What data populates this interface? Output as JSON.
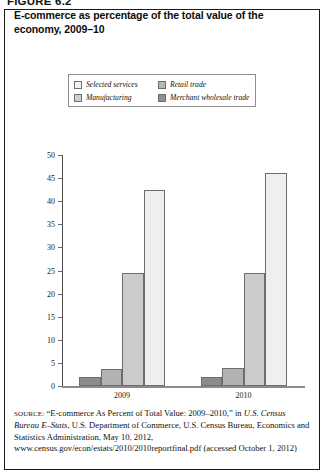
{
  "figure": {
    "number_label": "FIGURE 6.2"
  },
  "title": "E-commerce as percentage of the total value of the economy, 2009–10",
  "legend": {
    "position": "top-center",
    "entries": [
      {
        "label": "Selected services",
        "color": "#f2f2f2",
        "swatch_name": "legend-swatch-selected-services"
      },
      {
        "label": "Retail trade",
        "color": "#b5b5b5",
        "swatch_name": "legend-swatch-retail-trade"
      },
      {
        "label": "Manufacturing",
        "color": "#cfcfcf",
        "swatch_name": "legend-swatch-manufacturing"
      },
      {
        "label": "Merchant wholesale trade",
        "color": "#8f8f8f",
        "swatch_name": "legend-swatch-merchant-wholesale-trade"
      }
    ]
  },
  "chart_data": {
    "type": "bar",
    "title": "E-commerce as percentage of the total value of the economy, 2009–10",
    "xlabel": "",
    "ylabel": "",
    "categories": [
      "2009",
      "2010"
    ],
    "ylim": [
      0,
      50
    ],
    "yticks": [
      0,
      5,
      10,
      15,
      20,
      25,
      30,
      35,
      40,
      45,
      50
    ],
    "ytick_labels": [
      "0",
      "5",
      "10",
      "15",
      "20",
      "25",
      "30",
      "35",
      "40",
      "45",
      "50"
    ],
    "grid": false,
    "legend_position": "top-center",
    "series": [
      {
        "name": "Merchant wholesale trade",
        "color": "#8c8c8c",
        "values": [
          2.0,
          2.0
        ]
      },
      {
        "name": "Retail trade",
        "color": "#b2b2b2",
        "values": [
          3.7,
          4.0
        ]
      },
      {
        "name": "Manufacturing",
        "color": "#cbcbcb",
        "values": [
          24.5,
          24.5
        ]
      },
      {
        "name": "Selected services",
        "color": "#efefef",
        "values": [
          42.5,
          46.0
        ]
      }
    ]
  },
  "source": {
    "label": "SOURCE:",
    "text": " “E-commerce As Percent of Total Value: 2009–2010,” in ",
    "italic1": "U.S. Census Bureau E–Stats",
    "text2": ", U.S. Department of Commerce, U.S. Census Bureau, Economics and Statistics Administration, May 10, 2012, www.census.gov/econ/estats/2010/2010reportfinal.pdf (accessed October 1, 2012)"
  }
}
